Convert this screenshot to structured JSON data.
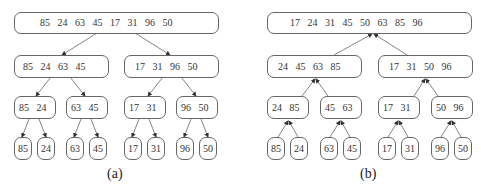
{
  "diagrams": [
    {
      "caption": "(a)",
      "levels": [
        [
          "85   24   63   45   17   31   96   50"
        ],
        [
          "85   24   63   45",
          "17   31   96   50"
        ],
        [
          "85   24",
          "63   45",
          "17   31",
          "96   50"
        ],
        [
          "85",
          "24",
          "63",
          "45",
          "17",
          "31",
          "96",
          "50"
        ]
      ],
      "arrow_direction": "down"
    },
    {
      "caption": "(b)",
      "levels": [
        [
          "17   24   31   45   50   63   85   96"
        ],
        [
          "24   45   63   85",
          "17   31   50   96"
        ],
        [
          "24   85",
          "45   63",
          "17   31",
          "50   96"
        ],
        [
          "85",
          "24",
          "63",
          "45",
          "17",
          "31",
          "96",
          "50"
        ]
      ],
      "arrow_direction": "up"
    }
  ],
  "colors": {
    "stroke": "#666666",
    "text": "#333333"
  }
}
